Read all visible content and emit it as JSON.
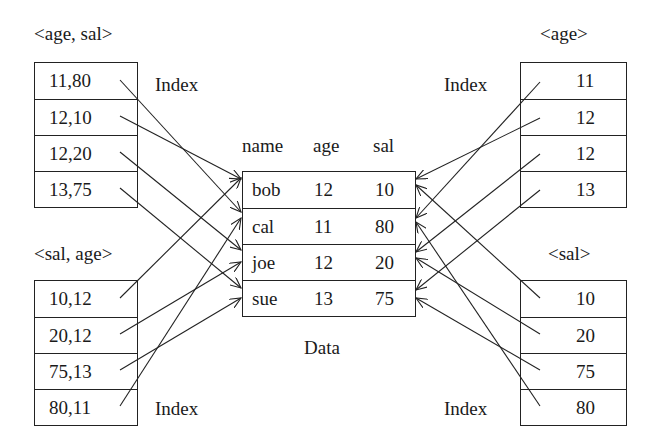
{
  "diagram": {
    "left_top_index": {
      "title": "<age, sal>",
      "caption": "Index",
      "entries": [
        "11,80",
        "12,10",
        "12,20",
        "13,75"
      ]
    },
    "left_bottom_index": {
      "title": "<sal, age>",
      "caption": "Index",
      "entries": [
        "10,12",
        "20,12",
        "75,13",
        "80,11"
      ]
    },
    "right_top_index": {
      "title": "<age>",
      "caption": "Index",
      "entries": [
        "11",
        "12",
        "12",
        "13"
      ]
    },
    "right_bottom_index": {
      "title": "<sal>",
      "caption": "Index",
      "entries": [
        "10",
        "20",
        "75",
        "80"
      ]
    },
    "data_table": {
      "caption": "Data",
      "headers": [
        "name",
        "age",
        "sal"
      ],
      "rows": [
        [
          "bob",
          "12",
          "10"
        ],
        [
          "cal",
          "11",
          "80"
        ],
        [
          "joe",
          "12",
          "20"
        ],
        [
          "sue",
          "13",
          "75"
        ]
      ]
    },
    "pointers": {
      "left_top_index": [
        "cal",
        "bob",
        "joe",
        "sue"
      ],
      "left_bottom_index": [
        "bob",
        "joe",
        "sue",
        "cal"
      ],
      "right_top_index": [
        "cal",
        "bob",
        "joe",
        "sue"
      ],
      "right_bottom_index": [
        "bob",
        "joe",
        "sue",
        "cal"
      ]
    },
    "colors": {
      "line": "#222222",
      "background": "#ffffff"
    }
  }
}
